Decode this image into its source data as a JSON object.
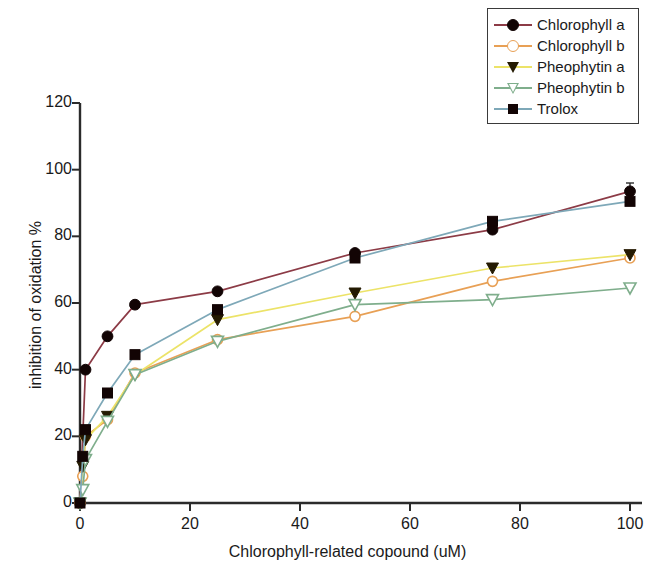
{
  "chart_data": {
    "type": "line",
    "title": "",
    "xlabel": "Chlorophyll-related copound  (uM)",
    "ylabel": "inhibition of oxidation %",
    "xlim": [
      0,
      100
    ],
    "ylim": [
      0,
      120
    ],
    "xticks": [
      0,
      20,
      40,
      60,
      80,
      100
    ],
    "yticks": [
      0,
      20,
      40,
      60,
      80,
      100,
      120
    ],
    "xtick_labels": [
      "0",
      "20",
      "40",
      "60",
      "80",
      "100"
    ],
    "ytick_labels": [
      "0",
      "20",
      "40",
      "60",
      "80",
      "100",
      "120"
    ],
    "grid": false,
    "legend_position": "top-right",
    "series": [
      {
        "name": "Chlorophyll a",
        "color": "#8c3b46",
        "marker": "circle-filled",
        "marker_color": "#120404",
        "x": [
          0,
          1,
          5,
          10,
          25,
          50,
          75,
          100
        ],
        "values": [
          0,
          40.0,
          50.0,
          59.5,
          63.5,
          75.0,
          82.0,
          93.5
        ],
        "error_bars": [
          0,
          0,
          0,
          0,
          0,
          0,
          0,
          2.5
        ]
      },
      {
        "name": "Chlorophyll b",
        "color": "#e8a055",
        "marker": "circle-open",
        "marker_color": "#e8a055",
        "x": [
          0,
          0.5,
          1,
          5,
          10,
          25,
          50,
          75,
          100
        ],
        "values": [
          0,
          8.0,
          20.0,
          25.0,
          39.0,
          49.0,
          56.0,
          66.5,
          73.5
        ],
        "error_bars": [
          0,
          0,
          0,
          0,
          0,
          0,
          0,
          0,
          0
        ]
      },
      {
        "name": "Pheophytin a",
        "color": "#ece368",
        "marker": "triangle-down-filled",
        "marker_color": "#241a02",
        "x": [
          0,
          0.5,
          1,
          5,
          10,
          25,
          50,
          75,
          100
        ],
        "values": [
          0,
          11.0,
          19.0,
          26.0,
          38.5,
          55.0,
          63.0,
          70.5,
          74.5
        ],
        "error_bars": [
          0,
          0,
          0,
          0,
          0,
          0,
          0,
          0,
          0
        ]
      },
      {
        "name": "Pheophytin b",
        "color": "#7fae8c",
        "marker": "triangle-down-open",
        "marker_color": "#7fae8c",
        "x": [
          0,
          0.5,
          1,
          5,
          10,
          25,
          50,
          75,
          100
        ],
        "values": [
          0,
          4.0,
          13.0,
          24.5,
          38.5,
          48.5,
          59.5,
          61.0,
          64.5
        ],
        "error_bars": [
          0,
          0,
          0,
          0,
          0,
          0,
          0,
          0,
          0
        ]
      },
      {
        "name": "Trolox",
        "color": "#7ea8b8",
        "marker": "square-filled",
        "marker_color": "#120404",
        "x": [
          0,
          0.5,
          1,
          5,
          10,
          25,
          50,
          75,
          100
        ],
        "values": [
          0,
          14.0,
          22.0,
          33.0,
          44.5,
          58.0,
          73.5,
          84.5,
          90.5
        ],
        "error_bars": [
          0,
          0,
          0,
          0,
          0,
          0,
          0,
          0,
          0
        ]
      }
    ]
  },
  "legend": {
    "items": [
      {
        "label": "Chlorophyll a"
      },
      {
        "label": "Chlorophyll b"
      },
      {
        "label": "Pheophytin a"
      },
      {
        "label": "Pheophytin b"
      },
      {
        "label": "Trolox"
      }
    ]
  },
  "axes": {
    "x_title": "Chlorophyll-related copound  (uM)",
    "y_title": "inhibition of oxidation %"
  }
}
